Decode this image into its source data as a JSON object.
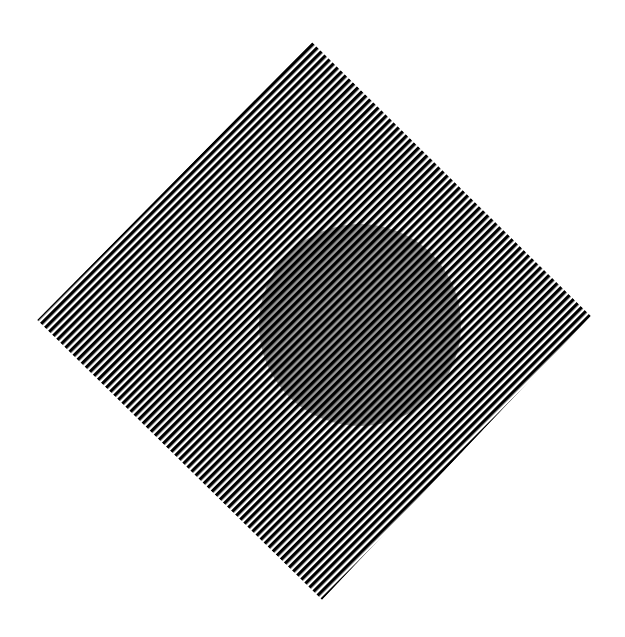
{
  "figure": {
    "type": "optical-illusion",
    "background_color": "#ffffff",
    "diamond": {
      "top": [
        312,
        42
      ],
      "right": [
        591,
        316
      ],
      "bottom": [
        322,
        600
      ],
      "left": [
        37,
        320
      ],
      "stripe_color": "#000000",
      "gap_color": "#ffffff",
      "stripe_direction": "lower-left to upper-right",
      "stripe_period_px": 5.7,
      "stripe_width_px": 3.3
    },
    "circle": {
      "center": [
        360,
        325
      ],
      "radius": 101,
      "gap_fill_color": "#9b9b9b"
    }
  }
}
